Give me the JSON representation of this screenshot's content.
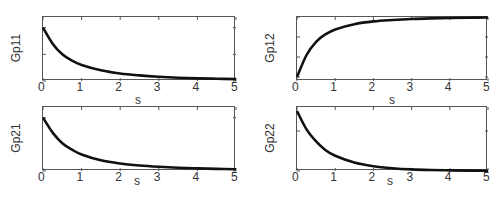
{
  "chart_data": [
    {
      "type": "line",
      "title": "",
      "xlabel": "s",
      "ylabel": "Gp11",
      "xlim": [
        0,
        5
      ],
      "ylim": [
        0,
        12
      ],
      "xticks": [
        0,
        1,
        2,
        3,
        4,
        5
      ],
      "yticks": [
        0,
        5,
        10
      ],
      "grid": false,
      "series": [
        {
          "name": "Gp11",
          "x": [
            0,
            0.25,
            0.5,
            0.75,
            1,
            1.5,
            2,
            2.5,
            3,
            3.5,
            4,
            4.5,
            5
          ],
          "values": [
            10,
            7.0,
            5.0,
            3.8,
            3.0,
            2.0,
            1.4,
            1.05,
            0.8,
            0.62,
            0.5,
            0.42,
            0.35
          ]
        }
      ]
    },
    {
      "type": "line",
      "title": "",
      "xlabel": "s",
      "ylabel": "Gp12",
      "xlim": [
        0,
        5
      ],
      "ylim": [
        -16,
        0
      ],
      "xticks": [
        0,
        1,
        2,
        3,
        4,
        5
      ],
      "yticks": [
        -15,
        -10,
        -5,
        0
      ],
      "grid": false,
      "series": [
        {
          "name": "Gp12",
          "x": [
            0,
            0.25,
            0.5,
            0.75,
            1,
            1.5,
            2,
            2.5,
            3,
            3.5,
            4,
            4.5,
            5
          ],
          "values": [
            -15,
            -9.5,
            -6.2,
            -4.3,
            -3.1,
            -1.8,
            -1.1,
            -0.75,
            -0.5,
            -0.35,
            -0.25,
            -0.18,
            -0.13
          ]
        }
      ]
    },
    {
      "type": "line",
      "title": "",
      "xlabel": "s",
      "ylabel": "Gp21",
      "xlim": [
        0,
        5
      ],
      "ylim": [
        0,
        6
      ],
      "xticks": [
        0,
        1,
        2,
        3,
        4,
        5
      ],
      "yticks": [
        0,
        5
      ],
      "grid": false,
      "series": [
        {
          "name": "Gp21",
          "x": [
            0,
            0.25,
            0.5,
            0.75,
            1,
            1.5,
            2,
            2.5,
            3,
            3.5,
            4,
            4.5,
            5
          ],
          "values": [
            5,
            3.6,
            2.6,
            2.0,
            1.55,
            1.0,
            0.7,
            0.52,
            0.4,
            0.31,
            0.25,
            0.2,
            0.17
          ]
        }
      ]
    },
    {
      "type": "line",
      "title": "",
      "xlabel": "s",
      "ylabel": "Gp22",
      "xlim": [
        0,
        5
      ],
      "ylim": [
        0,
        8
      ],
      "xticks": [
        0,
        1,
        2,
        3,
        4,
        5
      ],
      "yticks": [
        0,
        5
      ],
      "grid": false,
      "series": [
        {
          "name": "Gp22",
          "x": [
            0,
            0.25,
            0.5,
            0.75,
            1,
            1.5,
            2,
            2.5,
            3,
            3.5,
            4,
            4.5,
            5
          ],
          "values": [
            7.5,
            5.2,
            3.7,
            2.6,
            1.9,
            1.05,
            0.6,
            0.35,
            0.2,
            0.12,
            0.08,
            0.05,
            0.03
          ]
        }
      ]
    }
  ],
  "layout": {
    "panels": [
      {
        "left": 42,
        "top": 16,
        "width": 193,
        "height": 64,
        "xlabel_pos": [
          135,
          93
        ]
      },
      {
        "left": 296,
        "top": 16,
        "width": 191,
        "height": 64,
        "xlabel_pos": [
          389,
          93
        ]
      },
      {
        "left": 42,
        "top": 106,
        "width": 193,
        "height": 64,
        "xlabel_pos": [
          134,
          174
        ]
      },
      {
        "left": 296,
        "top": 106,
        "width": 191,
        "height": 64,
        "xlabel_pos": [
          387,
          174
        ]
      }
    ],
    "line_color": "#111111",
    "axis_color": "#555555"
  }
}
